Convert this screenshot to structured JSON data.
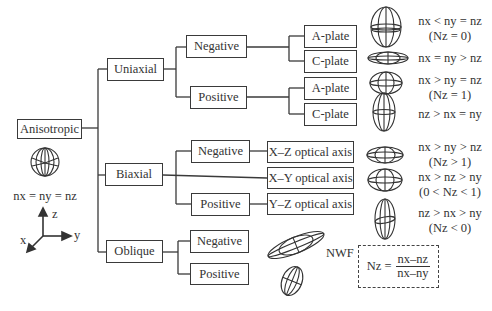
{
  "root": {
    "label": "Anisotropic",
    "isotropic_relation": "nx = ny = nz"
  },
  "axes": {
    "z": "z",
    "y": "y",
    "x": "x"
  },
  "uniaxial": {
    "label": "Uniaxial",
    "negative": {
      "label": "Negative",
      "a_plate": "A-plate",
      "c_plate": "C-plate"
    },
    "positive": {
      "label": "Positive",
      "a_plate": "A-plate",
      "c_plate": "C-plate"
    }
  },
  "biaxial": {
    "label": "Biaxial",
    "negative": {
      "label": "Negative",
      "axis": "X–Z optical axis"
    },
    "xy_axis": "X–Y optical axis",
    "positive": {
      "label": "Positive",
      "axis": "Y–Z optical axis"
    }
  },
  "oblique": {
    "label": "Oblique",
    "negative": {
      "label": "Negative"
    },
    "positive": {
      "label": "Positive"
    }
  },
  "relations": [
    {
      "line1": "nx < ny = nz",
      "line2": "(Nz = 0)"
    },
    {
      "line1": "nx = ny > nz",
      "line2": ""
    },
    {
      "line1": "nx > ny = nz",
      "line2": "(Nz = 1)"
    },
    {
      "line1": "nz > nx = ny",
      "line2": ""
    },
    {
      "line1": "nx > ny > nz",
      "line2": "(Nz > 1)"
    },
    {
      "line1": "nx > nz > ny",
      "line2": "(0 < Nz < 1)"
    },
    {
      "line1": "nz > nx > ny",
      "line2": "(Nz < 0)"
    }
  ],
  "nwf": {
    "label": "NWF",
    "lhs": "Nz =",
    "numerator": "nx–nz",
    "denominator": "nx–ny"
  }
}
